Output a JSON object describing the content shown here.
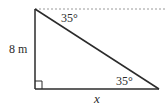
{
  "diagram": {
    "type": "right-triangle",
    "vertices": {
      "top": [
        35,
        9
      ],
      "right_angle": [
        35,
        89
      ],
      "right": [
        159,
        89
      ]
    },
    "labels": {
      "vertical_side": "8 m",
      "horizontal_side": "x",
      "angle_top": "35°",
      "angle_bottom_right": "35°"
    },
    "horizontal_reference": "dashed",
    "colors": {
      "line": "#2b2b2b",
      "dashed": "#9a9a9a",
      "text": "#2b2b2b"
    }
  }
}
